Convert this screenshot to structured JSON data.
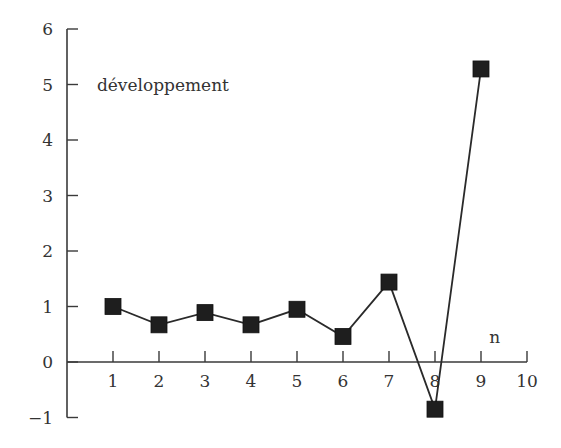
{
  "chart_data": {
    "type": "line",
    "title": "",
    "xlabel": "n",
    "ylabel": "",
    "series": [
      {
        "name": "développement",
        "x": [
          1,
          2,
          3,
          4,
          5,
          6,
          7,
          8,
          9
        ],
        "values": [
          1.0,
          0.67,
          0.89,
          0.67,
          0.95,
          0.46,
          1.44,
          -0.85,
          5.28
        ],
        "marker": "square",
        "color": "#1e1e1e"
      }
    ],
    "xlim": [
      0,
      10
    ],
    "ylim": [
      -1,
      6
    ],
    "xticks": [
      1,
      2,
      3,
      4,
      5,
      6,
      7,
      8,
      9,
      10
    ],
    "yticks": [
      -1,
      0,
      1,
      2,
      3,
      4,
      5,
      6
    ],
    "ytick_labels": [
      "−1",
      "0",
      "1",
      "2",
      "3",
      "4",
      "5",
      "6"
    ],
    "grid": false,
    "legend": "none",
    "annotations": [
      {
        "text": "développement",
        "x": 0.65,
        "y": 5.0
      },
      {
        "text": "n",
        "x": 9.3,
        "y": 0.45
      }
    ]
  }
}
